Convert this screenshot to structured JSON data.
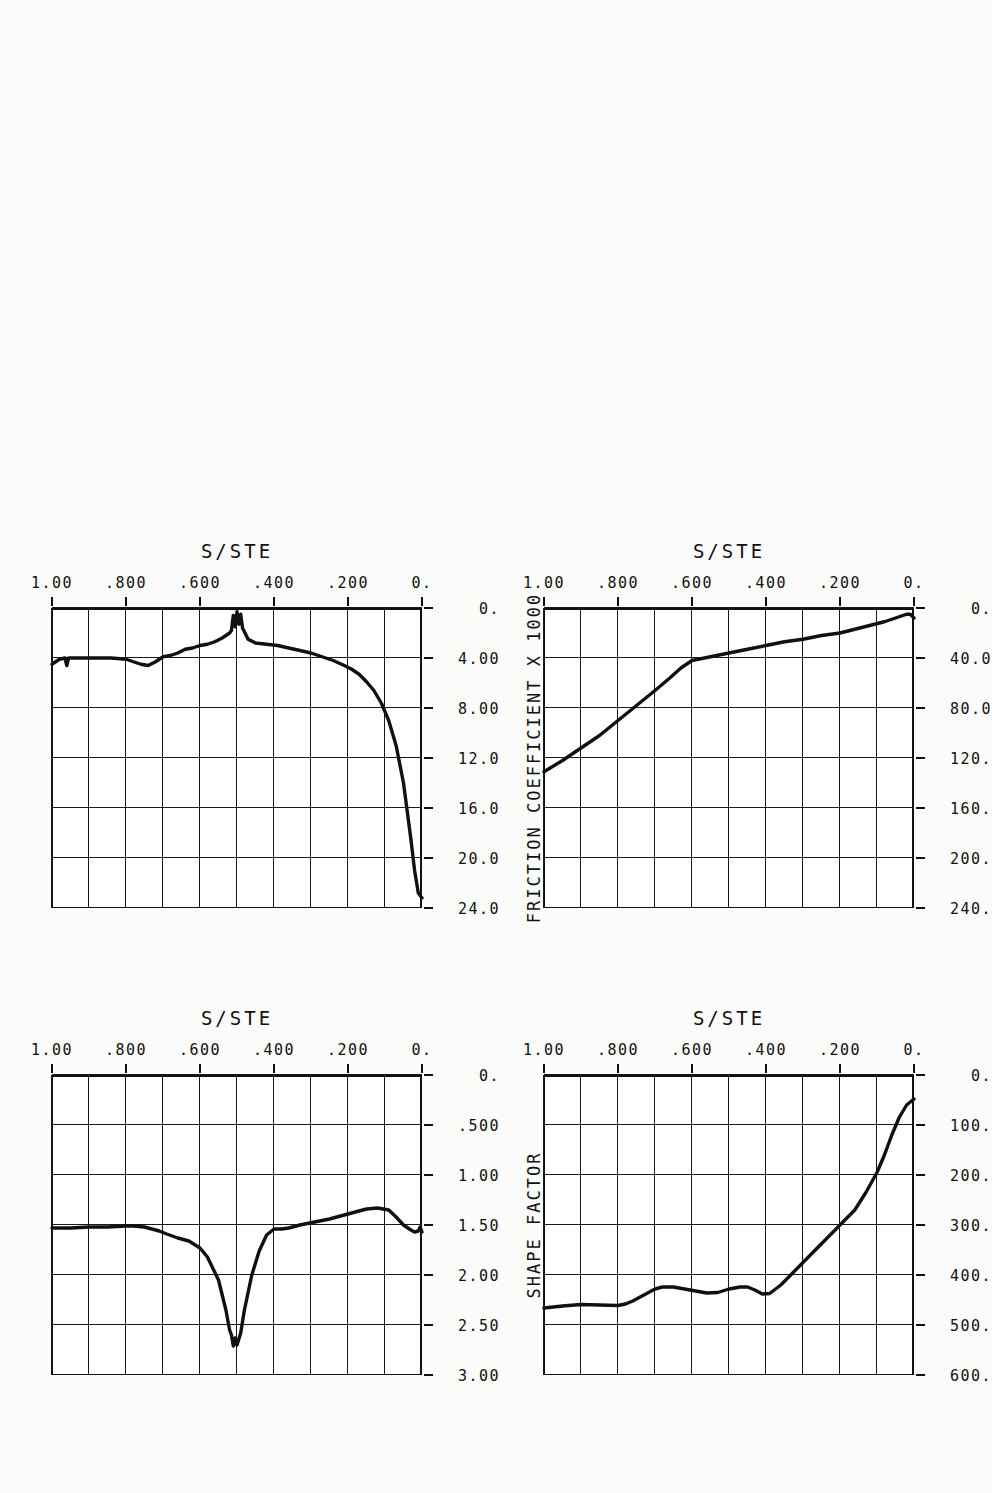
{
  "figure": {
    "orientation": "rotated-180",
    "panel_count": 4,
    "shared_xlabel": "S/STE"
  },
  "chart_data": [
    {
      "id": "velocity",
      "type": "line",
      "title": "",
      "xlabel": "S/STE",
      "ylabel": "VELOCITY, [M/S]",
      "xlim": [
        0,
        1.0
      ],
      "ylim": [
        0,
        600
      ],
      "xticks": [
        "0.",
        ".200",
        ".400",
        ".600",
        ".800",
        "1.00"
      ],
      "yticks": [
        "0.",
        "100.",
        "200.",
        "300.",
        "400.",
        "500.",
        "600."
      ],
      "grid": true,
      "legend": "none",
      "x": [
        0.0,
        0.02,
        0.04,
        0.06,
        0.08,
        0.1,
        0.13,
        0.16,
        0.2,
        0.24,
        0.28,
        0.32,
        0.36,
        0.39,
        0.41,
        0.43,
        0.45,
        0.47,
        0.5,
        0.53,
        0.56,
        0.59,
        0.62,
        0.65,
        0.68,
        0.7,
        0.72,
        0.74,
        0.76,
        0.78,
        0.8,
        0.85,
        0.9,
        0.95,
        1.0
      ],
      "y": [
        48,
        60,
        85,
        120,
        160,
        195,
        235,
        270,
        300,
        330,
        360,
        390,
        420,
        437,
        438,
        430,
        424,
        424,
        428,
        435,
        436,
        432,
        428,
        424,
        424,
        428,
        436,
        444,
        452,
        458,
        461,
        460,
        459,
        462,
        466
      ]
    },
    {
      "id": "shape-factor",
      "type": "line",
      "title": "",
      "xlabel": "S/STE",
      "ylabel": "SHAPE FACTOR",
      "xlim": [
        0,
        1.0
      ],
      "ylim": [
        0,
        3.0
      ],
      "xticks": [
        "0.",
        ".200",
        ".400",
        ".600",
        ".800",
        "1.00"
      ],
      "yticks": [
        "0.",
        ".500",
        "1.00",
        "1.50",
        "2.00",
        "2.50",
        "3.00"
      ],
      "grid": true,
      "legend": "none",
      "x": [
        0.0,
        0.005,
        0.01,
        0.02,
        0.03,
        0.05,
        0.07,
        0.09,
        0.12,
        0.15,
        0.18,
        0.21,
        0.25,
        0.29,
        0.33,
        0.36,
        0.38,
        0.4,
        0.42,
        0.44,
        0.46,
        0.48,
        0.49,
        0.5,
        0.505,
        0.51,
        0.515,
        0.52,
        0.53,
        0.55,
        0.58,
        0.6,
        0.63,
        0.66,
        0.69,
        0.71,
        0.73,
        0.75,
        0.78,
        0.8,
        0.85,
        0.9,
        0.95,
        1.0
      ],
      "y": [
        1.57,
        1.52,
        1.56,
        1.57,
        1.55,
        1.5,
        1.42,
        1.35,
        1.33,
        1.34,
        1.37,
        1.4,
        1.44,
        1.47,
        1.5,
        1.53,
        1.54,
        1.54,
        1.6,
        1.76,
        2.0,
        2.35,
        2.58,
        2.7,
        2.63,
        2.71,
        2.6,
        2.55,
        2.35,
        2.05,
        1.82,
        1.73,
        1.66,
        1.63,
        1.59,
        1.56,
        1.54,
        1.52,
        1.51,
        1.51,
        1.52,
        1.52,
        1.53,
        1.53
      ]
    },
    {
      "id": "momentum-thickness",
      "type": "line",
      "title": "",
      "xlabel": "S/STE",
      "ylabel": "MOMENTUM THICK., 1.0E06 [M]",
      "xlim": [
        0,
        1.0
      ],
      "ylim": [
        0,
        240
      ],
      "xticks": [
        "0.",
        ".200",
        ".400",
        ".600",
        ".800",
        "1.00"
      ],
      "yticks": [
        "0.",
        "40.0",
        "80.0",
        "120.",
        "160.",
        "200.",
        "240."
      ],
      "grid": true,
      "legend": "none",
      "x": [
        0.0,
        0.01,
        0.02,
        0.03,
        0.05,
        0.08,
        0.12,
        0.16,
        0.2,
        0.25,
        0.3,
        0.35,
        0.4,
        0.45,
        0.5,
        0.55,
        0.6,
        0.63,
        0.66,
        0.7,
        0.75,
        0.8,
        0.85,
        0.9,
        0.95,
        1.0
      ],
      "y": [
        8,
        5,
        5,
        6,
        8,
        11,
        14,
        17,
        20,
        22,
        25,
        27,
        30,
        33,
        36,
        39,
        42,
        48,
        56,
        66,
        78,
        90,
        102,
        112,
        122,
        131
      ]
    },
    {
      "id": "friction-coefficient",
      "type": "line",
      "title": "",
      "xlabel": "S/STE",
      "ylabel": "FRICTION COEFFICIENT X 1000",
      "xlim": [
        0,
        1.0
      ],
      "ylim": [
        0,
        24.0
      ],
      "xticks": [
        "0.",
        ".200",
        ".400",
        ".600",
        ".800",
        "1.00"
      ],
      "yticks": [
        "0.",
        "4.00",
        "8.00",
        "12.0",
        "16.0",
        "20.0",
        "24.0"
      ],
      "grid": true,
      "legend": "none",
      "x": [
        0.0,
        0.01,
        0.02,
        0.03,
        0.05,
        0.07,
        0.09,
        0.11,
        0.13,
        0.15,
        0.17,
        0.19,
        0.21,
        0.24,
        0.27,
        0.3,
        0.33,
        0.36,
        0.39,
        0.42,
        0.45,
        0.47,
        0.485,
        0.49,
        0.495,
        0.5,
        0.505,
        0.51,
        0.515,
        0.52,
        0.54,
        0.56,
        0.58,
        0.6,
        0.62,
        0.64,
        0.66,
        0.68,
        0.7,
        0.72,
        0.74,
        0.76,
        0.78,
        0.8,
        0.84,
        0.88,
        0.92,
        0.955,
        0.96,
        0.965,
        0.98,
        0.99,
        1.0
      ],
      "y": [
        23.2,
        22.8,
        21.0,
        18.5,
        14.0,
        11.0,
        9.0,
        7.6,
        6.6,
        5.9,
        5.3,
        4.9,
        4.6,
        4.2,
        3.9,
        3.6,
        3.4,
        3.2,
        3.0,
        2.9,
        2.8,
        2.5,
        1.6,
        0.5,
        1.3,
        0.3,
        1.5,
        0.6,
        1.8,
        2.0,
        2.4,
        2.7,
        2.9,
        3.0,
        3.2,
        3.3,
        3.6,
        3.8,
        3.9,
        4.3,
        4.6,
        4.5,
        4.3,
        4.1,
        4.0,
        4.0,
        4.0,
        4.0,
        4.6,
        4.0,
        4.1,
        4.3,
        4.5
      ]
    }
  ],
  "labels": {
    "velocity_axis_title": "VELOCITY, [M/S]",
    "shape_factor_axis_title": "SHAPE FACTOR",
    "momentum_axis_title": "MOMENTUM THICK., 1.0E06 [M]",
    "friction_axis_title": "FRICTION COEFFICIENT X 1000",
    "x_axis_title": "S/STE"
  }
}
